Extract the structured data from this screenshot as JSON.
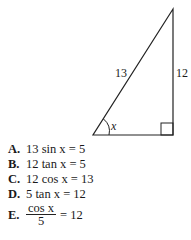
{
  "figure": {
    "type": "right-triangle",
    "hypotenuse_label": "13",
    "vertical_side_label": "12",
    "angle_label": "x",
    "vertices": {
      "apex": [
        173,
        9
      ],
      "bottom_left": [
        93,
        135
      ],
      "bottom_right": [
        173,
        135
      ]
    }
  },
  "choices": [
    {
      "letter": "A.",
      "text": "13 sin x = 5"
    },
    {
      "letter": "B.",
      "text": "12 tan x = 5"
    },
    {
      "letter": "C.",
      "text": "12 cos x = 13"
    },
    {
      "letter": "D.",
      "text": "5 tan x = 12"
    },
    {
      "letter": "E.",
      "numerator": "cos x",
      "denominator": "5",
      "rhs": "= 12"
    }
  ]
}
